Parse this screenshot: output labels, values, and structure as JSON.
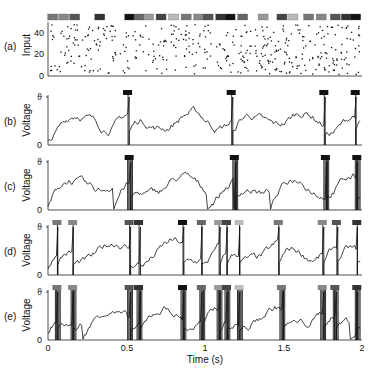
{
  "figure": {
    "xlabel": "Time (s)",
    "xticks": [
      "0",
      "0.5",
      "1",
      "1.5",
      "2"
    ],
    "panels": [
      {
        "id": "a",
        "label": "(a)",
        "ylabel": "Input",
        "yticks": [
          "0",
          "20",
          "40"
        ]
      },
      {
        "id": "b",
        "label": "(b)",
        "ylabel": "Voltage",
        "ytop": "ϑ",
        "ybottom": "0"
      },
      {
        "id": "c",
        "label": "(c)",
        "ylabel": "Voltage",
        "ytop": "ϑ",
        "ybottom": "0"
      },
      {
        "id": "d",
        "label": "(d)",
        "ylabel": "Voltage",
        "ytop": "ϑ",
        "ybottom": "0"
      },
      {
        "id": "e",
        "label": "(e)",
        "ylabel": "Voltage",
        "ytop": "ϑ",
        "ybottom": "0"
      }
    ]
  },
  "chart_data": [
    {
      "type": "scatter",
      "title": "(a) Input spike raster",
      "xlabel": "Time (s)",
      "ylabel": "Input",
      "xlim": [
        0,
        2
      ],
      "ylim": [
        0,
        50
      ],
      "yticks": [
        0,
        20,
        40
      ],
      "note": "Random input spikes from ~50 afferents; grey-shaded bars above indicate embedded pattern occurrences",
      "pattern_bar_times": [
        0.03,
        0.1,
        0.17,
        0.33,
        0.52,
        0.58,
        0.64,
        0.72,
        0.8,
        0.88,
        0.96,
        1.02,
        1.1,
        1.16,
        1.24,
        1.37,
        1.49,
        1.56,
        1.66,
        1.74,
        1.83,
        1.9,
        1.96
      ]
    },
    {
      "type": "line",
      "title": "(b) Voltage",
      "xlabel": "Time (s)",
      "ylabel": "Voltage",
      "xlim": [
        0,
        2
      ],
      "ylim": [
        "0",
        "ϑ"
      ],
      "spike_times": [
        0.51,
        1.17,
        1.76,
        1.96
      ]
    },
    {
      "type": "line",
      "title": "(c) Voltage",
      "xlabel": "Time (s)",
      "ylabel": "Voltage",
      "xlim": [
        0,
        2
      ],
      "ylim": [
        "0",
        "ϑ"
      ],
      "burst_times": [
        0.52,
        1.19,
        1.77,
        1.97
      ]
    },
    {
      "type": "line",
      "title": "(d) Voltage",
      "xlabel": "Time (s)",
      "ylabel": "Voltage",
      "xlim": [
        0,
        2
      ],
      "ylim": [
        "0",
        "ϑ"
      ],
      "spike_times": [
        0.06,
        0.16,
        0.52,
        0.58,
        0.86,
        0.98,
        1.09,
        1.14,
        1.22,
        1.47,
        1.75,
        1.84,
        1.97
      ]
    },
    {
      "type": "line",
      "title": "(e) Voltage",
      "xlabel": "Time (s)",
      "ylabel": "Voltage",
      "xlim": [
        0,
        2
      ],
      "ylim": [
        "0",
        "ϑ"
      ],
      "burst_times": [
        0.06,
        0.16,
        0.52,
        0.58,
        0.86,
        0.98,
        1.09,
        1.14,
        1.22,
        1.49,
        1.75,
        1.83,
        1.97
      ]
    }
  ]
}
